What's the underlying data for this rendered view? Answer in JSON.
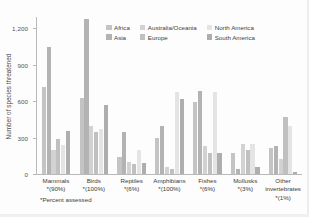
{
  "chart_data": {
    "type": "bar",
    "title": "",
    "xlabel": "",
    "ylabel": "Number of species threatened",
    "ylim": [
      0,
      1300
    ],
    "yticks": [
      0,
      300,
      600,
      900,
      1200
    ],
    "ytick_labels": [
      "0",
      "300",
      "600",
      "900",
      "1,200"
    ],
    "grid": false,
    "legend_position": "top-center",
    "footnote": "*Percent assessed",
    "categories": [
      "Mammals",
      "Birds",
      "Reptiles",
      "Amphibians",
      "Fishes",
      "Mollusks",
      "Other invertebrates"
    ],
    "category_percent_assessed": [
      "*(90%)",
      "*(100%)",
      "*(6%)",
      "*(100%)",
      "*(6%)",
      "*(3%)",
      "*(1%)"
    ],
    "series": [
      {
        "name": "Africa",
        "color": "#c4c4c4",
        "values": [
          720,
          630,
          145,
          295,
          595,
          170,
          215
        ]
      },
      {
        "name": "Asia",
        "color": "#b3b3b3",
        "values": [
          1050,
          1280,
          350,
          400,
          685,
          45,
          235
        ]
      },
      {
        "name": "Australia/Oceania",
        "color": "#d2d2d2",
        "values": [
          200,
          395,
          100,
          55,
          235,
          250,
          125
        ]
      },
      {
        "name": "Europe",
        "color": "#c0c0c0",
        "values": [
          290,
          345,
          85,
          40,
          175,
          195,
          475
        ]
      },
      {
        "name": "North America",
        "color": "#e4e4e4",
        "values": [
          240,
          370,
          200,
          675,
          675,
          250,
          395
        ]
      },
      {
        "name": "South America",
        "color": "#aeaeae",
        "values": [
          355,
          570,
          90,
          620,
          170,
          55,
          15
        ]
      }
    ]
  },
  "legend": {
    "columns": [
      {
        "entries": [
          {
            "label": "Africa",
            "color": "#c4c4c4",
            "key": "africa"
          },
          {
            "label": "Asia",
            "color": "#b3b3b3",
            "key": "asia"
          }
        ]
      },
      {
        "entries": [
          {
            "label": "Australia/Oceania",
            "color": "#d2d2d2",
            "key": "australiaoceania"
          },
          {
            "label": "Europe",
            "color": "#c0c0c0",
            "key": "europe"
          }
        ]
      },
      {
        "entries": [
          {
            "label": "North America",
            "color": "#e4e4e4",
            "key": "northamerica"
          },
          {
            "label": "South America",
            "color": "#aeaeae",
            "key": "southamerica"
          }
        ]
      }
    ]
  },
  "axis": {
    "y_title": "Number of species threatened",
    "footnote": "*Percent assessed"
  }
}
